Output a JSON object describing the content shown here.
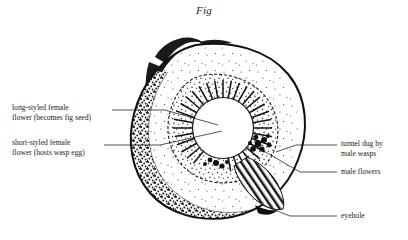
{
  "figure": {
    "title": "Fig",
    "background_color": "#ffffff",
    "ink_color": "#1a1a1a"
  },
  "labels": [
    {
      "id": "long-styled-female-flower",
      "lines": [
        "long-styled female",
        "flower (becomes fig seed)"
      ],
      "side": "left",
      "x": 12,
      "y": 105
    },
    {
      "id": "short-styled-female-flower",
      "lines": [
        "short-styled female",
        "flower (hosts wasp egg)"
      ],
      "side": "left",
      "x": 12,
      "y": 140
    },
    {
      "id": "tunnel-dug-by-male-wasps",
      "lines": [
        "tunnel dug by",
        "male wasps"
      ],
      "side": "right",
      "x": 340,
      "y": 141
    },
    {
      "id": "male-flowers",
      "lines": [
        "male flowers"
      ],
      "side": "right",
      "x": 340,
      "y": 167
    },
    {
      "id": "eyehole",
      "lines": [
        "eyehole"
      ],
      "side": "right",
      "x": 340,
      "y": 212
    }
  ],
  "leaders": [
    {
      "id": "leader-long-styled",
      "points": "112,110 165,110 218,125"
    },
    {
      "id": "leader-short-styled",
      "points": "104,145 160,145 222,131"
    },
    {
      "id": "leader-tunnel",
      "points": "337,145 296,145 276,152"
    },
    {
      "id": "leader-male-flowers",
      "points": "337,172 300,172 262,150"
    },
    {
      "id": "leader-eyehole",
      "points": "337,216 290,216 262,205"
    }
  ],
  "anatomy": {
    "outer_rind": "fig body outline with thick dark rind",
    "stem": "forked curved stem at upper left",
    "stipple_field": "stippled flesh interior",
    "flower_ring": "ring of radially oriented female flowers around cavity",
    "cavity": "central white cavity",
    "male_flower_clusters": "dark blobby clusters on inner right wall",
    "tunnel_hatching": "hatched tunnel band at lower right",
    "eyehole_opening": "opening at bottom right of fig"
  }
}
